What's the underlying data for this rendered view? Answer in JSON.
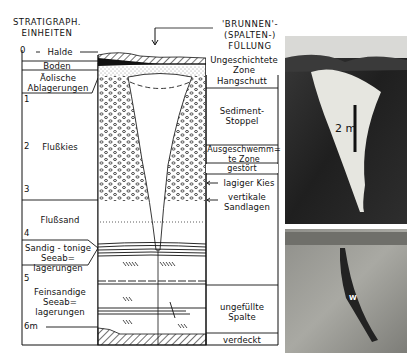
{
  "figure": {
    "left_header": {
      "line1": "STRATIGRAPH.",
      "line2": "EINHEITEN"
    },
    "top_header": {
      "line1": "'BRUNNEN'-",
      "line2": "(SPALTEN-)",
      "line3": "FÜLLUNG"
    },
    "depth_ticks": [
      {
        "label": "0",
        "y": 50
      },
      {
        "label": "1",
        "y": 99
      },
      {
        "label": "2",
        "y": 146
      },
      {
        "label": "3",
        "y": 189
      },
      {
        "label": "4",
        "y": 233
      },
      {
        "label": "5",
        "y": 278
      },
      {
        "label": "6m",
        "y": 322
      }
    ],
    "left_units": [
      {
        "label": "Halde"
      },
      {
        "label": "Boden"
      },
      {
        "label": "Äolische Ablagerungen",
        "line1": "Äolische",
        "line2": "Ablagerungen"
      },
      {
        "label": "Flußkies"
      },
      {
        "label": "Flußsand"
      },
      {
        "label": "Sandig-tonige Seeablagerungen",
        "line1": "Sandig - tonige",
        "line2": "Seeab=",
        "line3": "lagerungen"
      },
      {
        "label": "Feinsandige Seeablagerungen",
        "line1": "Feinsandige",
        "line2": "Seeab=",
        "line3": "lagerungen"
      }
    ],
    "right_units": [
      {
        "label": "Ungeschichtete Zone",
        "line1": "Ungeschichtete",
        "line2": "Zone"
      },
      {
        "label": "Hangschutt"
      },
      {
        "label": "Sediment-Stoppel",
        "line1": "Sediment-",
        "line2": "Stoppel"
      },
      {
        "label": "Ausgeschwemmte Zone",
        "line1": "Ausgeschwemm=",
        "line2": "te Zone"
      },
      {
        "label": "gestört"
      },
      {
        "label": "lagiger Kies"
      },
      {
        "label": "vertikale Sandlagen",
        "line1": "vertikale",
        "line2": "Sandlagen"
      },
      {
        "label": "ungefüllte Spalte",
        "line1": "ungefüllte",
        "line2": "Spalte"
      },
      {
        "label": "verdeckt"
      }
    ],
    "photos": [
      {
        "name": "top-photo",
        "scale_label": "2 m"
      },
      {
        "name": "bottom-photo",
        "marker_label": "W"
      }
    ],
    "colors": {
      "ink": "#111111",
      "paper": "#ffffff",
      "photo_dark": "#2a2a2a",
      "photo_light": "#e6e6e0"
    }
  }
}
